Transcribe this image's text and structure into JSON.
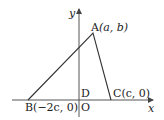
{
  "diagram": {
    "type": "coordinate-triangle",
    "axes": {
      "x_label": "x",
      "y_label": "y",
      "origin_label": "O"
    },
    "points": {
      "A": {
        "name": "A",
        "coords": "(a, b)",
        "px": [
          93,
          33
        ]
      },
      "B": {
        "name": "B",
        "coords": "(−2c, 0)",
        "px": [
          28,
          100
        ]
      },
      "C": {
        "name": "C",
        "coords": "(c, 0)",
        "px": [
          111,
          100
        ]
      },
      "D": {
        "name": "D",
        "px": [
          79,
          100
        ]
      }
    },
    "labels": {
      "A": "A(a, b)",
      "A_name": "A",
      "A_coords": "(a, b)",
      "B_name": "B",
      "B_coords": "(−2c, 0)",
      "C_name": "C",
      "C_coords": "(c, 0)",
      "D": "D",
      "O": "O",
      "x": "x",
      "y": "y"
    },
    "colors": {
      "line": "#333333",
      "axis": "#555555"
    }
  }
}
